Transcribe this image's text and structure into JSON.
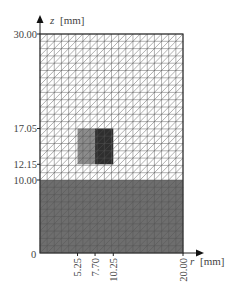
{
  "figure": {
    "type": "finite-element-mesh",
    "y_axis": {
      "label_var": "z",
      "label_unit": "[mm]",
      "ticks": [
        "30.00",
        "17.05",
        "12.15",
        "10.00"
      ],
      "tick_values": [
        30.0,
        17.05,
        12.15,
        10.0
      ]
    },
    "x_axis": {
      "label_var": "r",
      "label_unit": "[mm]",
      "ticks": [
        "5.25",
        "7.70",
        "10.25",
        "20.00"
      ],
      "tick_values": [
        5.25,
        7.7,
        10.25,
        20.0
      ]
    },
    "origin_label": "0",
    "domain": {
      "r_min": 0,
      "r_max": 20,
      "z_min": 0,
      "z_max": 30,
      "cols": 20,
      "rows": 30
    },
    "regions": [
      {
        "name": "substrate",
        "r": [
          0,
          20
        ],
        "z": [
          0,
          10
        ],
        "color": "#6e6e6e"
      },
      {
        "name": "inclusion-outer",
        "r": [
          5.25,
          7.7
        ],
        "z": [
          12.15,
          17.05
        ],
        "color": "#8c8c8c"
      },
      {
        "name": "inclusion-inner",
        "r": [
          7.7,
          10.25
        ],
        "z": [
          12.15,
          17.05
        ],
        "color": "#2e2e2e"
      }
    ],
    "colors": {
      "mesh_line": "#555555",
      "background": "#ffffff",
      "axis": "#222222"
    }
  }
}
